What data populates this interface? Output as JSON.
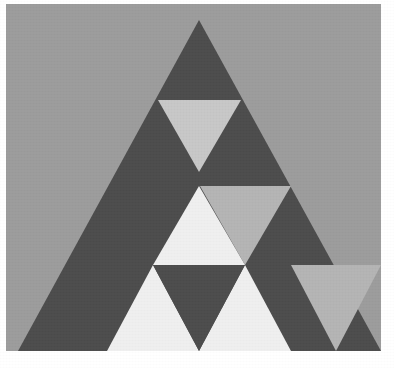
{
  "figure": {
    "subtitle": "Recursive subdivided triangle figure",
    "canvas": {
      "width": 394,
      "height": 368,
      "page_background": "#ffffff"
    },
    "backdrop": {
      "name": "gray-backdrop",
      "x": 6,
      "y": 4,
      "width": 375,
      "height": 347,
      "color": "#9c9c9c"
    },
    "palette": {
      "page_white": "#ffffff",
      "backdrop_gray": "#9c9c9c",
      "dark_gray": "#4c4c4c",
      "mid_gray": "#b4b4b4",
      "light_gray": "#c7c7c7",
      "near_white": "#efefef"
    },
    "outer_triangle": {
      "name": "outer-triangle",
      "apex": [
        199,
        20
      ],
      "bottom_left": [
        18,
        351
      ],
      "bottom_right": [
        381,
        351
      ],
      "fill": "#4c4c4c"
    },
    "shapes": [
      {
        "id": "tri-top-inverted",
        "label": "Top inverted triangle",
        "orientation": "down",
        "points": "158,100 241,100 199,172",
        "fill": "#c7c7c7"
      },
      {
        "id": "tri-mid-right-inverted",
        "label": "Middle right inverted triangle",
        "orientation": "down",
        "points": "200,186 291,186 245,265",
        "fill": "#b4b4b4"
      },
      {
        "id": "tri-center-upright-light",
        "label": "Center upright light triangle",
        "orientation": "up",
        "points": "199,186 245,265 153,265",
        "fill": "#efefef"
      },
      {
        "id": "tri-bottom-left-light",
        "label": "Bottom left light triangle",
        "orientation": "up",
        "points": "153,265 199,351 107,351",
        "fill": "#efefef"
      },
      {
        "id": "tri-bottom-mid-light",
        "label": "Bottom middle light triangle",
        "orientation": "up",
        "points": "245,265 291,351 199,351",
        "fill": "#efefef"
      },
      {
        "id": "tri-bottom-inverted-dark",
        "label": "Bottom middle inverted dark triangle",
        "orientation": "down",
        "points": "153,265 245,265 199,351",
        "fill": "#4c4c4c"
      },
      {
        "id": "tri-bottom-right-inverted",
        "label": "Bottom right inverted triangle",
        "orientation": "down",
        "points": "291,265 381,265 336,351",
        "fill": "#b4b4b4"
      }
    ],
    "structure_notes": {
      "levels": 3,
      "left_half": "solid dark, undivided",
      "right_half": "recursively subdivided"
    }
  }
}
